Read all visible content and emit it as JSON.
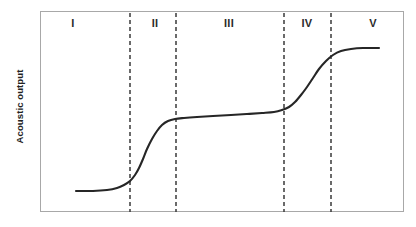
{
  "chart_data": {
    "type": "line",
    "title": "",
    "xlabel": "",
    "ylabel": "Acoustic output",
    "grid": false,
    "legend": null,
    "xlim": [
      0,
      364
    ],
    "ylim": [
      0,
      201
    ],
    "axes_visible": {
      "top": true,
      "right": true,
      "bottom": true,
      "left": true
    },
    "tick_labels": {
      "x": [],
      "y": []
    },
    "series": [
      {
        "name": "acoustic-output-curve",
        "color": "#262626",
        "width": 2.1,
        "style": "solid",
        "points": [
          [
            35,
            179
          ],
          [
            52,
            179
          ],
          [
            66,
            178
          ],
          [
            76,
            176
          ],
          [
            83,
            173
          ],
          [
            89,
            169
          ],
          [
            94,
            163
          ],
          [
            98,
            156
          ],
          [
            102,
            147
          ],
          [
            106,
            137
          ],
          [
            111,
            127
          ],
          [
            116,
            119
          ],
          [
            121,
            113
          ],
          [
            127,
            109
          ],
          [
            134,
            107
          ],
          [
            143,
            106
          ],
          [
            156,
            105
          ],
          [
            172,
            104
          ],
          [
            190,
            103
          ],
          [
            206,
            102
          ],
          [
            221,
            101
          ],
          [
            233,
            100
          ],
          [
            241,
            98
          ],
          [
            248,
            95
          ],
          [
            254,
            90
          ],
          [
            260,
            83
          ],
          [
            266,
            75
          ],
          [
            272,
            66
          ],
          [
            278,
            57
          ],
          [
            285,
            49
          ],
          [
            292,
            43
          ],
          [
            300,
            39
          ],
          [
            310,
            37
          ],
          [
            322,
            36
          ],
          [
            338,
            36
          ]
        ]
      }
    ],
    "dividers": [
      {
        "name": "boundary-I-II",
        "x": 89,
        "style": "dashed",
        "color": "#3a3a3a"
      },
      {
        "name": "boundary-II-III",
        "x": 135,
        "style": "dashed",
        "color": "#3a3a3a"
      },
      {
        "name": "boundary-III-IV",
        "x": 243,
        "style": "dashed",
        "color": "#3a3a3a"
      },
      {
        "name": "boundary-IV-V",
        "x": 290,
        "style": "dashed",
        "color": "#3a3a3a"
      }
    ],
    "regions": [
      {
        "label": "I",
        "center_x": 73,
        "span": [
          40,
          129
        ]
      },
      {
        "label": "II",
        "center_x": 155,
        "span": [
          129,
          175
        ]
      },
      {
        "label": "III",
        "center_x": 229,
        "span": [
          175,
          283
        ]
      },
      {
        "label": "IV",
        "center_x": 307,
        "span": [
          283,
          330
        ]
      },
      {
        "label": "V",
        "center_x": 373,
        "span": [
          330,
          404
        ]
      }
    ]
  },
  "axis": {
    "y_label": "Acoustic output"
  },
  "colors": {
    "curve": "#262626",
    "divider": "#3a3a3a",
    "frame": "#a8a8a8",
    "text": "#222222",
    "background": "#ffffff"
  }
}
